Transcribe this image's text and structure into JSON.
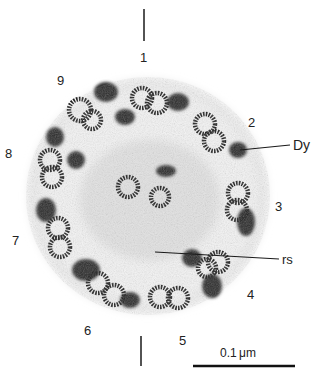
{
  "figure": {
    "type": "electron-micrograph",
    "doublet_labels": [
      {
        "text": "1",
        "x": 140,
        "y": 51
      },
      {
        "text": "2",
        "x": 248,
        "y": 116
      },
      {
        "text": "3",
        "x": 275,
        "y": 200
      },
      {
        "text": "4",
        "x": 247,
        "y": 288
      },
      {
        "text": "5",
        "x": 179,
        "y": 334
      },
      {
        "text": "6",
        "x": 84,
        "y": 324
      },
      {
        "text": "7",
        "x": 12,
        "y": 234
      },
      {
        "text": "8",
        "x": 5,
        "y": 147
      },
      {
        "text": "9",
        "x": 57,
        "y": 74
      }
    ],
    "annotations": [
      {
        "id": "dynein",
        "text": "Dy",
        "x": 293,
        "y": 139
      },
      {
        "id": "radial-spoke",
        "text": "rs",
        "x": 282,
        "y": 253
      }
    ],
    "scale_bar": {
      "label": "0.1 μm",
      "x1": 193,
      "x2": 295,
      "y": 366
    },
    "colors": {
      "ink": "#1a1a1a",
      "background": "#ffffff",
      "tissue_light": "#e6e6e6",
      "tissue_dark": "#2a2a2a"
    }
  }
}
